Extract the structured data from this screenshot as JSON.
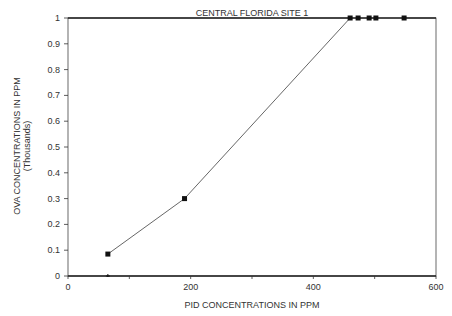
{
  "chart_data": {
    "type": "line",
    "title": "CENTRAL FLORIDA SITE 1",
    "xlabel": "PID CONCENTRATIONS IN PPM",
    "ylabel": "OVA CONCENTRATIONS IN PPM",
    "ylabel_sub": "(Thousands)",
    "xlim": [
      0,
      600
    ],
    "ylim": [
      0,
      1
    ],
    "xticks": [
      "0",
      "200",
      "400",
      "600"
    ],
    "yticks": [
      "0",
      "0.1",
      "0.2",
      "0.3",
      "0.4",
      "0.5",
      "0.6",
      "0.7",
      "0.8",
      "0.9",
      "1"
    ],
    "grid": false,
    "series": [
      {
        "name": "OVA vs PID",
        "x": [
          65,
          190,
          460,
          473,
          491,
          502,
          548
        ],
        "y": [
          0.085,
          0.3,
          1.0,
          1.0,
          1.0,
          1.0,
          1.0
        ]
      },
      {
        "name": "baseline point",
        "x": [
          65
        ],
        "y": [
          0
        ]
      }
    ]
  }
}
